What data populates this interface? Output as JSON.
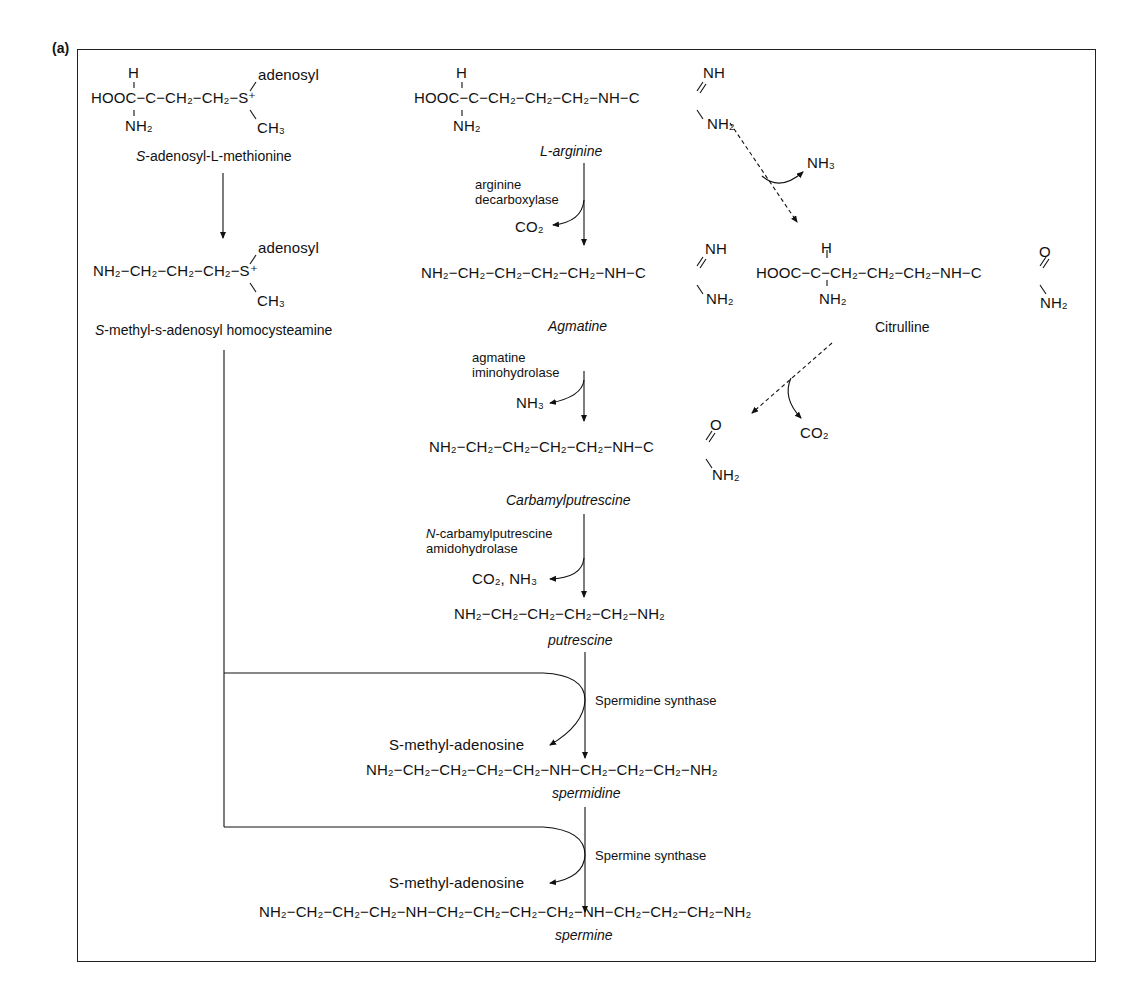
{
  "panel_label": "(a)",
  "sam": {
    "h": "H",
    "chain": "HOOC−C−CH₂−CH₂−S⁺",
    "nh2": "NH₂",
    "adenosyl": "adenosyl",
    "ch3": "CH₃",
    "name_prefix": "S",
    "name_rest": "-adenosyl-L-methionine"
  },
  "decarb_sam": {
    "chain": "NH₂−CH₂−CH₂−CH₂−S⁺",
    "adenosyl": "adenosyl",
    "ch3": "CH₃",
    "name_prefix": "S",
    "name_rest": "-methyl-s-adenosyl homocysteamine"
  },
  "arginine": {
    "h": "H",
    "chain": "HOOC−C−CH₂−CH₂−CH₂−NH−C",
    "nh2_alpha": "NH₂",
    "nh": "NH",
    "nh2_guan": "NH₂",
    "name": "L-arginine"
  },
  "step1": {
    "enzyme_line1": "arginine",
    "enzyme_line2": "decarboxylase",
    "byproduct": "CO₂"
  },
  "agmatine": {
    "chain": "NH₂−CH₂−CH₂−CH₂−CH₂−NH−C",
    "nh": "NH",
    "nh2": "NH₂",
    "name": "Agmatine"
  },
  "alt_step1": {
    "byproduct": "NH₃"
  },
  "citrulline": {
    "h": "H",
    "chain": "HOOC−C−CH₂−CH₂−CH₂−NH−C",
    "nh2_alpha": "NH₂",
    "o": "O",
    "nh2_urea": "NH₂",
    "name": "Citrulline"
  },
  "alt_step2": {
    "byproduct": "CO₂"
  },
  "step2": {
    "enzyme_line1": "agmatine",
    "enzyme_line2": "iminohydrolase",
    "byproduct": "NH₃"
  },
  "carbamylputrescine": {
    "chain": "NH₂−CH₂−CH₂−CH₂−CH₂−NH−C",
    "o": "O",
    "nh2": "NH₂",
    "name": "Carbamylputrescine"
  },
  "step3": {
    "enzyme_line1_prefix": "N",
    "enzyme_line1_rest": "-carbamylputrescine",
    "enzyme_line2": "amidohydrolase",
    "byproduct": "CO₂, NH₃"
  },
  "putrescine": {
    "chain": "NH₂−CH₂−CH₂−CH₂−CH₂−NH₂",
    "name": "putrescine"
  },
  "step4": {
    "enzyme": "Spermidine synthase",
    "byproduct": "S-methyl-adenosine"
  },
  "spermidine": {
    "chain": "NH₂−CH₂−CH₂−CH₂−CH₂−NH−CH₂−CH₂−CH₂−NH₂",
    "name": "spermidine"
  },
  "step5": {
    "enzyme": "Spermine synthase",
    "byproduct": "S-methyl-adenosine"
  },
  "spermine": {
    "chain": "NH₂−CH₂−CH₂−CH₂−NH−CH₂−CH₂−CH₂−CH₂−NH−CH₂−CH₂−CH₂−NH₂",
    "name": "spermine"
  },
  "colors": {
    "ink": "#111111",
    "frame": "#222222",
    "background": "#ffffff"
  }
}
